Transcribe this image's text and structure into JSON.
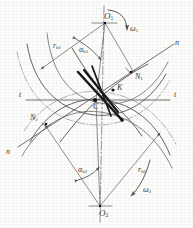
{
  "figure": {
    "type": "gear-meshing-geometry-diagram",
    "background_color": "#fdfdfc",
    "line_color": "#5a5a5a",
    "accent_color": "#1a1a1a",
    "centerline_color": "#6a6a6a"
  },
  "labels": {
    "center_top": "O",
    "center_top_sub": "1",
    "center_bottom": "O",
    "center_bottom_sub": "2",
    "omega_top": "ω",
    "omega_top_sub": "1",
    "omega_bottom": "ω",
    "omega_bottom_sub": "2",
    "radius_top": "r",
    "radius_top_sub": "b1",
    "radius_bottom": "r",
    "radius_bottom_sub": "b2",
    "angle_top": "α",
    "angle_top_sub": "b1",
    "angle_bottom": "α",
    "angle_bottom_sub": "b2",
    "normal_top": "N",
    "normal_top_sub": "1",
    "normal_bottom": "N",
    "normal_bottom_sub": "2",
    "pitch_point": "C",
    "contact_point": "K",
    "tangent_left": "t",
    "tangent_right": "t",
    "normal_line_right": "n",
    "normal_line_left": "n"
  },
  "label_positions": {
    "O1": [
      104,
      12
    ],
    "omega1": [
      128,
      27
    ],
    "rb1": [
      55,
      44
    ],
    "alpha_b1": [
      81,
      48
    ],
    "n_right": [
      176,
      42
    ],
    "N1": [
      136,
      76
    ],
    "K": [
      118,
      87
    ],
    "t_left": [
      20,
      93
    ],
    "t_right": [
      175,
      93
    ],
    "C": [
      95,
      105
    ],
    "N2": [
      31,
      117
    ],
    "n_left": [
      7,
      151
    ],
    "alpha_b2": [
      80,
      168
    ],
    "rb2": [
      139,
      168
    ],
    "omega2": [
      144,
      188
    ],
    "O2": [
      100,
      211
    ]
  },
  "geometry": {
    "O1": [
      105,
      22
    ],
    "O2": [
      100,
      207
    ],
    "C": [
      95,
      100
    ],
    "K": [
      113,
      90
    ],
    "N1": [
      131,
      72
    ],
    "N2": [
      46,
      124
    ],
    "base_radius_1": 78,
    "base_radius_2": 85,
    "pressure_angle_deg": 20
  }
}
